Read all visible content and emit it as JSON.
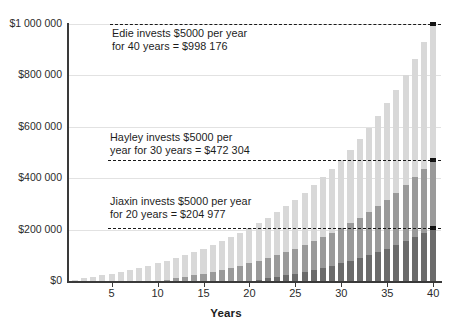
{
  "chart_data": {
    "type": "bar",
    "title": "",
    "subtitle": "",
    "xlabel": "Years",
    "ylabel": "",
    "xlim": [
      0,
      41
    ],
    "ylim": [
      0,
      1000000
    ],
    "grid": true,
    "legend_position": "none",
    "stacked": false,
    "overlapping": true,
    "x": [
      1,
      2,
      3,
      4,
      5,
      6,
      7,
      8,
      9,
      10,
      11,
      12,
      13,
      14,
      15,
      16,
      17,
      18,
      19,
      20,
      21,
      22,
      23,
      24,
      25,
      26,
      27,
      28,
      29,
      30,
      31,
      32,
      33,
      34,
      35,
      36,
      37,
      38,
      39,
      40
    ],
    "y_tick_labels": [
      "$0",
      "$200 000",
      "$400 000",
      "$600 000",
      "$800 000",
      "$1 000 000"
    ],
    "y_tick_values": [
      0,
      200000,
      400000,
      600000,
      800000,
      1000000
    ],
    "x_tick_labels": [
      "5",
      "10",
      "15",
      "20",
      "25",
      "30",
      "35",
      "40"
    ],
    "x_tick_values": [
      5,
      10,
      15,
      20,
      25,
      30,
      35,
      40
    ],
    "series": [
      {
        "name": "Edie",
        "label": "Edie invests $5000 per year for 40 years",
        "color": "#d8d8d8",
        "final_value": 998176,
        "years_invested": 40,
        "annual_contribution": 5000,
        "start_year": 1,
        "values": [
          5000,
          10350,
          16075,
          22200,
          28754,
          35767,
          43271,
          51300,
          59891,
          69082,
          78918,
          89442,
          100703,
          112752,
          125645,
          139440,
          154201,
          169995,
          186894,
          204977,
          224325,
          245028,
          267180,
          290882,
          316244,
          343381,
          372418,
          403487,
          436731,
          472304,
          510365,
          551091,
          594667,
          641294,
          691184,
          744567,
          801686,
          862804,
          928200,
          998176
        ]
      },
      {
        "name": "Hayley",
        "label": "Hayley invests $5000 per year for 30 years",
        "color": "#9a9a9a",
        "final_value": 472304,
        "years_invested": 30,
        "annual_contribution": 5000,
        "start_year": 11,
        "values": [
          0,
          0,
          0,
          0,
          0,
          0,
          0,
          0,
          0,
          0,
          5000,
          10350,
          16075,
          22200,
          28754,
          35767,
          43271,
          51300,
          59891,
          69082,
          78918,
          89442,
          100703,
          112752,
          125645,
          139440,
          154201,
          169995,
          186894,
          204977,
          224325,
          245028,
          267180,
          290882,
          316244,
          343381,
          372418,
          403487,
          436731,
          472304
        ]
      },
      {
        "name": "Jiaxin",
        "label": "Jiaxin invests $5000 per year for 20 years",
        "color": "#6b6b6b",
        "final_value": 204977,
        "years_invested": 20,
        "annual_contribution": 5000,
        "start_year": 21,
        "values": [
          0,
          0,
          0,
          0,
          0,
          0,
          0,
          0,
          0,
          0,
          0,
          0,
          0,
          0,
          0,
          0,
          0,
          0,
          0,
          0,
          5000,
          10350,
          16075,
          22200,
          28754,
          35767,
          43271,
          51300,
          59891,
          69082,
          78918,
          89442,
          100703,
          112752,
          125645,
          139440,
          154201,
          169995,
          186894,
          204977
        ]
      }
    ],
    "annotations": [
      {
        "id": "edie",
        "text": "Edie invests $5000 per year\nfor 40 years = $998 176",
        "value": 998176,
        "line_color": "#1a1a1a",
        "line_style": "dashed"
      },
      {
        "id": "hayley",
        "text": "Hayley invests $5000 per\nyear for 30 years = $472 304",
        "value": 472304,
        "line_color": "#1a1a1a",
        "line_style": "dashed"
      },
      {
        "id": "jiaxin",
        "text": "Jiaxin invests $5000 per year\nfor 20 years = $204 977",
        "value": 204977,
        "line_color": "#1a1a1a",
        "line_style": "dashed"
      }
    ]
  },
  "axis": {
    "x_title": "Years"
  },
  "colors": {
    "edie": "#d8d8d8",
    "hayley": "#9a9a9a",
    "jiaxin": "#6b6b6b",
    "axis": "#3a3a3a",
    "grid": "#e2e2e2",
    "text": "#1c1c1c",
    "marker": "#111111",
    "background": "#ffffff"
  }
}
